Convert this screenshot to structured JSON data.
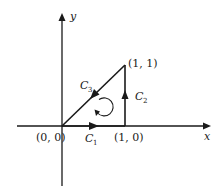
{
  "diagram": {
    "axes": {
      "x_label": "x",
      "y_label": "y"
    },
    "points": [
      {
        "name": "origin",
        "label": "(0, 0)"
      },
      {
        "name": "point-1-0",
        "label": "(1, 0)"
      },
      {
        "name": "point-1-1",
        "label": "(1, 1)"
      }
    ],
    "curves": [
      {
        "name": "C1",
        "letter": "C",
        "subscript": "1",
        "from": "(0, 0)",
        "to": "(1, 0)"
      },
      {
        "name": "C2",
        "letter": "C",
        "subscript": "2",
        "from": "(1, 0)",
        "to": "(1, 1)"
      },
      {
        "name": "C3",
        "letter": "C",
        "subscript": "3",
        "from": "(1, 1)",
        "to": "(0, 0)"
      }
    ],
    "orientation": "counterclockwise",
    "colors": {
      "ink": "#1a1a1a",
      "background": "#ffffff"
    }
  }
}
